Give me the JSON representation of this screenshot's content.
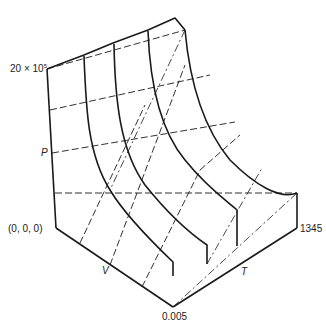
{
  "figure": {
    "axes": {
      "pressure": {
        "label": "P",
        "max_label": "20 × 10",
        "max_exp": "5"
      },
      "volume": {
        "label": "V",
        "max_label": "0.005"
      },
      "temperature": {
        "label": "T",
        "max_label": "1345"
      },
      "origin_label": "(0, 0, 0)"
    }
  }
}
